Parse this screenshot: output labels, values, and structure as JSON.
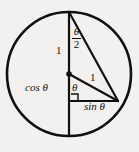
{
  "figure": {
    "background_color": "#f2f1ef",
    "stroke_color": "#12100f",
    "geometry": {
      "circle": {
        "cx": 69,
        "cy": 74,
        "r": 62,
        "stroke_width": 2.6
      },
      "center_dot": {
        "cx": 69,
        "cy": 74,
        "r": 2.6
      },
      "points": {
        "top": {
          "x": 69,
          "y": 12
        },
        "bottom": {
          "x": 69,
          "y": 136
        },
        "center": {
          "x": 69,
          "y": 74
        },
        "right_point": {
          "x": 118,
          "y": 101
        }
      },
      "segments": [
        {
          "name": "vertical-diameter",
          "x1": 69,
          "y1": 12,
          "x2": 69,
          "y2": 136,
          "width": 2.2
        },
        {
          "name": "chord-top-to-point",
          "x1": 69,
          "y1": 12,
          "x2": 118,
          "y2": 101,
          "width": 2.2
        },
        {
          "name": "radius-center-to-point",
          "x1": 69,
          "y1": 74,
          "x2": 118,
          "y2": 101,
          "width": 2.2
        },
        {
          "name": "horizontal-chord",
          "x1": 69,
          "y1": 101,
          "x2": 118,
          "y2": 101,
          "width": 2.0
        }
      ],
      "right_angle_marker": {
        "x": 71,
        "y": 94,
        "size": 7
      }
    },
    "labels": {
      "half_angle_numerator": "θ",
      "half_angle_denominator": "2",
      "radius_vertical": "1",
      "radius_slant": "1",
      "cosine": "cos θ",
      "center_angle": "θ",
      "sine": "sin θ"
    }
  }
}
